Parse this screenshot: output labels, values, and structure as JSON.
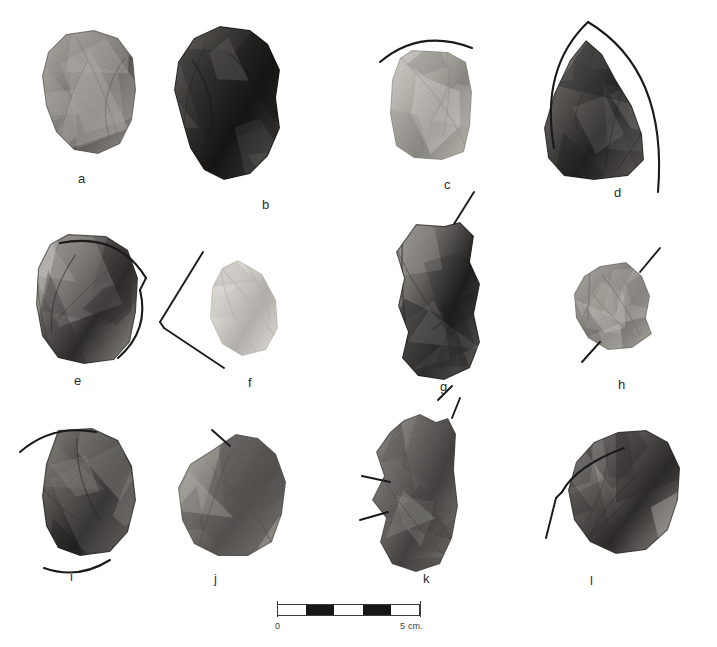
{
  "plate": {
    "width": 717,
    "height": 647,
    "background": "#ffffff",
    "ink_color": "#1a1a1a",
    "caption_color": "#2b2b2b"
  },
  "scale": {
    "start_label": "0",
    "end_label": "5 cm.",
    "segments": 5,
    "segment_fills": [
      "light",
      "dark",
      "light",
      "dark",
      "light"
    ],
    "bar_left": 277,
    "bar_top": 604,
    "bar_width": 143,
    "bar_height": 12
  },
  "specimens": [
    {
      "id": "a",
      "label": "a",
      "label_x": 78,
      "label_y": 172,
      "x": 36,
      "y": 28,
      "w": 105,
      "h": 128,
      "tone": "mid-grey",
      "shape": "M 30,6 L 58,2 L 82,10 L 97,30 L 100,62 L 96,92 L 84,116 L 62,126 L 38,122 L 20,104 L 10,78 L 6,48 L 12,24 Z",
      "annotations": []
    },
    {
      "id": "b",
      "label": "b",
      "label_x": 262,
      "label_y": 198,
      "x": 168,
      "y": 24,
      "w": 118,
      "h": 158,
      "tone": "dark",
      "shape": "M 52,2 L 82,6 L 100,20 L 112,46 L 108,74 L 112,104 L 100,132 L 82,150 L 56,156 L 36,146 L 22,124 L 14,96 L 6,66 L 10,38 L 26,14 Z",
      "annotations": []
    },
    {
      "id": "c",
      "label": "c",
      "label_x": 444,
      "label_y": 178,
      "x": 386,
      "y": 48,
      "w": 90,
      "h": 115,
      "tone": "light",
      "shape": "M 26,2 L 62,4 L 80,14 L 86,44 L 84,78 L 78,104 L 56,112 L 28,110 L 10,98 L 4,66 L 6,32 L 14,10 Z",
      "annotations": [
        {
          "kind": "arc",
          "path": "M 380,62 Q 420,28 472,48"
        }
      ]
    },
    {
      "id": "d",
      "label": "d",
      "label_x": 614,
      "label_y": 186,
      "x": 530,
      "y": 38,
      "w": 130,
      "h": 142,
      "tone": "dark-grainy",
      "shape": "M 56,2 L 72,16 L 86,42 L 102,68 L 112,96 L 114,122 L 98,138 L 64,142 L 34,138 L 18,120 L 14,90 L 24,56 L 40,22 Z",
      "annotations": [
        {
          "kind": "arc",
          "path": "M 588,22 Q 540,68 554,148"
        },
        {
          "kind": "arc",
          "path": "M 588,22 Q 668,70 658,192"
        }
      ]
    },
    {
      "id": "e",
      "label": "e",
      "label_x": 74,
      "label_y": 374,
      "x": 30,
      "y": 232,
      "w": 114,
      "h": 135,
      "tone": "split-dark-light",
      "shape": "M 38,2 L 76,4 L 98,18 L 108,46 L 106,80 L 100,110 L 84,128 L 54,132 L 28,126 L 12,104 L 6,72 L 8,36 L 20,12 Z",
      "annotations": [
        {
          "kind": "arc",
          "path": "M 60,243 Q 118,232 146,278"
        },
        {
          "kind": "line",
          "path": "M 146,278 L 140,290"
        },
        {
          "kind": "arc",
          "path": "M 140,290 Q 150,330 118,358"
        }
      ]
    },
    {
      "id": "f",
      "label": "f",
      "label_x": 248,
      "label_y": 376,
      "x": 204,
      "y": 258,
      "w": 78,
      "h": 100,
      "tone": "very-light",
      "shape": "M 34,2 L 58,16 L 72,42 L 74,70 L 62,92 L 38,98 L 18,86 L 6,60 L 8,30 L 18,10 Z",
      "annotations": [
        {
          "kind": "line",
          "path": "M 203,252 L 160,322"
        },
        {
          "kind": "line",
          "path": "M 160,322 L 164,328"
        },
        {
          "kind": "line",
          "path": "M 164,328 L 224,368"
        }
      ]
    },
    {
      "id": "g",
      "label": "g",
      "label_x": 440,
      "label_y": 380,
      "x": 382,
      "y": 222,
      "w": 106,
      "h": 160,
      "tone": "split-dark",
      "shape": "M 34,2 L 62,4 L 78,0 L 92,14 L 88,40 L 98,62 L 92,92 L 98,120 L 88,146 L 62,158 L 36,154 L 20,136 L 26,110 L 16,84 L 22,56 L 14,30 Z",
      "annotations": [
        {
          "kind": "line",
          "path": "M 474,192 L 454,224"
        },
        {
          "kind": "line",
          "path": "M 452,386 L 438,400"
        }
      ]
    },
    {
      "id": "h",
      "label": "h",
      "label_x": 618,
      "label_y": 378,
      "x": 570,
      "y": 262,
      "w": 86,
      "h": 90,
      "tone": "light-grainy",
      "shape": "M 30,4 L 56,0 L 72,14 L 80,34 L 76,56 L 82,72 L 62,86 L 38,88 L 18,76 L 6,56 L 4,32 L 14,14 Z",
      "annotations": [
        {
          "kind": "line",
          "path": "M 660,248 L 640,272"
        },
        {
          "kind": "line",
          "path": "M 582,362 L 600,342"
        }
      ]
    },
    {
      "id": "i",
      "label": "i",
      "label_x": 70,
      "label_y": 570,
      "x": 28,
      "y": 428,
      "w": 110,
      "h": 130,
      "tone": "dark-grainy",
      "shape": "M 30,2 L 64,0 L 90,12 L 104,38 L 108,72 L 100,104 L 82,124 L 52,128 L 30,120 L 18,98 L 14,68 L 18,36 Z",
      "annotations": [
        {
          "kind": "arc",
          "path": "M 20,452 Q 52,424 96,432"
        },
        {
          "kind": "arc",
          "path": "M 44,568 Q 78,580 110,560"
        }
      ]
    },
    {
      "id": "j",
      "label": "j",
      "label_x": 214,
      "label_y": 572,
      "x": 170,
      "y": 432,
      "w": 122,
      "h": 128,
      "tone": "mid-mottled",
      "shape": "M 42,18 L 66,2 L 88,6 L 106,22 L 116,50 L 112,82 L 102,110 L 78,124 L 48,124 L 24,112 L 12,88 L 8,56 L 20,32 Z",
      "annotations": [
        {
          "kind": "line",
          "path": "M 212,430 L 230,446"
        }
      ]
    },
    {
      "id": "k",
      "label": "k",
      "label_x": 423,
      "label_y": 572,
      "x": 358,
      "y": 414,
      "w": 110,
      "h": 160,
      "tone": "grainy-mid",
      "shape": "M 46,6 L 62,0 L 78,8 L 90,4 L 98,20 L 96,56 L 100,92 L 94,124 L 82,150 L 58,158 L 34,150 L 22,128 L 28,104 L 14,86 L 26,62 L 18,38 L 32,18 Z",
      "annotations": [
        {
          "kind": "line",
          "path": "M 460,398 L 452,418"
        },
        {
          "kind": "line",
          "path": "M 362,476 L 390,482"
        },
        {
          "kind": "line",
          "path": "M 360,520 L 388,512"
        }
      ]
    },
    {
      "id": "l",
      "label": "l",
      "label_x": 590,
      "label_y": 574,
      "x": 560,
      "y": 428,
      "w": 126,
      "h": 130,
      "tone": "split-dark-light",
      "shape": "M 34,14 L 58,4 L 86,2 L 108,14 L 120,40 L 118,72 L 108,102 L 86,122 L 56,126 L 30,114 L 14,92 L 8,62 L 16,34 Z",
      "annotations": [
        {
          "kind": "arc",
          "path": "M 624,448 Q 576,466 562,492"
        },
        {
          "kind": "line",
          "path": "M 562,492 L 556,498"
        },
        {
          "kind": "line",
          "path": "M 556,498 L 546,538"
        }
      ]
    }
  ]
}
